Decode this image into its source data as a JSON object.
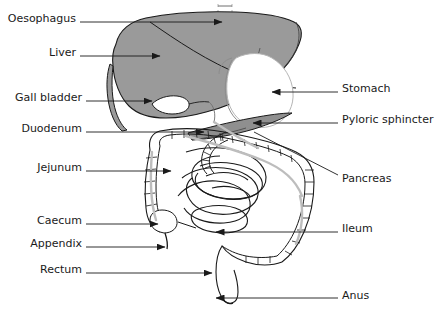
{
  "diagram": {
    "organs_left": [
      {
        "id": "oesophagus",
        "label": "Oesophagus",
        "label_x": 8,
        "label_y": 18,
        "line_x1": 80,
        "line_y1": 22,
        "line_x2": 222,
        "line_y2": 22,
        "arrow": "right"
      },
      {
        "id": "liver",
        "label": "Liver",
        "label_x": 51,
        "label_y": 52,
        "line_x1": 80,
        "line_y1": 56,
        "line_x2": 160,
        "line_y2": 56,
        "arrow": "right"
      },
      {
        "id": "gall-bladder",
        "label": "Gall bladder",
        "label_x": 12,
        "label_y": 97,
        "line_x1": 86,
        "line_y1": 101,
        "line_x2": 152,
        "line_y2": 101,
        "arrow": "right"
      },
      {
        "id": "duodenum",
        "label": "Duodenum",
        "label_x": 17,
        "label_y": 128,
        "line_x1": 86,
        "line_y1": 132,
        "line_x2": 204,
        "line_y2": 132,
        "arrow": "right"
      },
      {
        "id": "jejunum",
        "label": "Jejunum",
        "label_x": 33,
        "label_y": 167,
        "line_x1": 86,
        "line_y1": 171,
        "line_x2": 171,
        "line_y2": 171,
        "arrow": "right"
      },
      {
        "id": "caecum",
        "label": "Caecum",
        "label_x": 35,
        "label_y": 220,
        "line_x1": 86,
        "line_y1": 224,
        "line_x2": 158,
        "line_y2": 224,
        "arrow": "right"
      },
      {
        "id": "appendix",
        "label": "Appendix",
        "label_x": 28,
        "label_y": 243,
        "line_x1": 86,
        "line_y1": 247,
        "line_x2": 165,
        "line_y2": 247,
        "arrow": "right"
      },
      {
        "id": "rectum",
        "label": "Rectum",
        "label_x": 38,
        "label_y": 269,
        "line_x1": 86,
        "line_y1": 273,
        "line_x2": 212,
        "line_y2": 273,
        "arrow": "right"
      }
    ],
    "organs_right": [
      {
        "id": "stomach",
        "label": "Stomach",
        "label_x": 342,
        "label_y": 88,
        "line_x1": 338,
        "line_y1": 92,
        "line_x2": 272,
        "line_y2": 92,
        "arrow": "left"
      },
      {
        "id": "pyloric-sphincter",
        "label": "Pyloric sphincter",
        "label_x": 342,
        "label_y": 119,
        "line_x1": 338,
        "line_y1": 123,
        "line_x2": 253,
        "line_y2": 123,
        "arrow": "left"
      },
      {
        "id": "pancreas",
        "label": "Pancreas",
        "label_x": 342,
        "label_y": 178,
        "line_x1": 338,
        "line_y1": 175,
        "line_x2": 254,
        "line_y2": 132,
        "arrow": "none"
      },
      {
        "id": "ileum",
        "label": "Ileum",
        "label_x": 342,
        "label_y": 228,
        "line_x1": 338,
        "line_y1": 232,
        "line_x2": 216,
        "line_y2": 232,
        "arrow": "left"
      },
      {
        "id": "anus",
        "label": "Anus",
        "label_x": 342,
        "label_y": 295,
        "line_x1": 338,
        "line_y1": 298,
        "line_x2": 216,
        "line_y2": 298,
        "arrow": "left"
      }
    ],
    "colors": {
      "liver_fill": "#9a9a9a",
      "pancreas_fill": "#8f8f8f",
      "outline": "#1a1a1a",
      "light_outline": "#b5b5b5",
      "mid_gray": "#c9c9c9",
      "text": "#1a1a1a",
      "background": "#ffffff"
    }
  }
}
